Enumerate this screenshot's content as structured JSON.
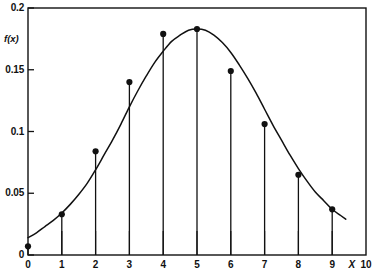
{
  "chart_data": {
    "type": "scatter",
    "title": "",
    "subtitle": "",
    "xlabel": "X",
    "ylabel": "f(x)",
    "x": [
      0,
      1,
      2,
      3,
      4,
      5,
      6,
      7,
      8,
      9
    ],
    "values": [
      0.007,
      0.033,
      0.084,
      0.14,
      0.179,
      0.183,
      0.149,
      0.106,
      0.065,
      0.037
    ],
    "categories": [
      "0",
      "1",
      "2",
      "3",
      "4",
      "5",
      "6",
      "7",
      "8",
      "9"
    ],
    "xlim": [
      0,
      10
    ],
    "ylim": [
      0,
      0.2
    ],
    "xticks": [
      0,
      1,
      2,
      3,
      4,
      5,
      6,
      7,
      8,
      9,
      10
    ],
    "xtick_labels": [
      "0",
      "1",
      "2",
      "3",
      "4",
      "5",
      "6",
      "7",
      "8",
      "9",
      "10"
    ],
    "yticks": [
      0,
      0.05,
      0.1,
      0.15,
      0.2
    ],
    "ytick_labels": [
      "0",
      "0.05",
      "0.1",
      "0.15",
      "0.2"
    ],
    "grid": false,
    "legend": null,
    "series": [
      {
        "name": "stem-points",
        "type": "stem",
        "values": [
          0.007,
          0.033,
          0.084,
          0.14,
          0.179,
          0.183,
          0.149,
          0.106,
          0.065,
          0.037
        ]
      },
      {
        "name": "density-curve",
        "type": "line",
        "curve_points": [
          [
            0.0,
            0.014
          ],
          [
            0.25,
            0.018
          ],
          [
            0.5,
            0.023
          ],
          [
            0.75,
            0.028
          ],
          [
            1.0,
            0.034
          ],
          [
            1.25,
            0.041
          ],
          [
            1.5,
            0.049
          ],
          [
            1.75,
            0.058
          ],
          [
            2.0,
            0.069
          ],
          [
            2.25,
            0.081
          ],
          [
            2.5,
            0.093
          ],
          [
            2.75,
            0.106
          ],
          [
            3.0,
            0.12
          ],
          [
            3.25,
            0.133
          ],
          [
            3.5,
            0.145
          ],
          [
            3.75,
            0.156
          ],
          [
            4.0,
            0.165
          ],
          [
            4.25,
            0.173
          ],
          [
            4.5,
            0.178
          ],
          [
            4.75,
            0.182
          ],
          [
            5.0,
            0.183
          ],
          [
            5.25,
            0.182
          ],
          [
            5.5,
            0.178
          ],
          [
            5.75,
            0.172
          ],
          [
            6.0,
            0.164
          ],
          [
            6.25,
            0.154
          ],
          [
            6.5,
            0.143
          ],
          [
            6.75,
            0.131
          ],
          [
            7.0,
            0.118
          ],
          [
            7.25,
            0.105
          ],
          [
            7.5,
            0.093
          ],
          [
            7.75,
            0.081
          ],
          [
            8.0,
            0.07
          ],
          [
            8.25,
            0.06
          ],
          [
            8.5,
            0.051
          ],
          [
            8.75,
            0.044
          ],
          [
            9.0,
            0.037
          ],
          [
            9.25,
            0.032
          ],
          [
            9.4,
            0.029
          ]
        ]
      }
    ]
  },
  "axes": {
    "y_title": "f(x)",
    "x_title": "X"
  }
}
